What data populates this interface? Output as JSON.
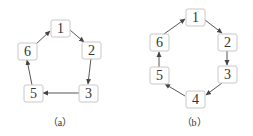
{
  "figures": [
    {
      "id": "a",
      "caption": "（a）",
      "nodes": [
        {
          "label": "1",
          "x": 51,
          "y": 20
        },
        {
          "label": "2",
          "x": 82,
          "y": 42
        },
        {
          "label": "3",
          "x": 79,
          "y": 85
        },
        {
          "label": "5",
          "x": 24,
          "y": 85
        },
        {
          "label": "6",
          "x": 18,
          "y": 43
        }
      ],
      "edges": [
        [
          "1",
          "2"
        ],
        [
          "2",
          "3"
        ],
        [
          "3",
          "5"
        ],
        [
          "5",
          "6"
        ],
        [
          "6",
          "1"
        ]
      ]
    },
    {
      "id": "b",
      "caption": "（b）",
      "nodes": [
        {
          "label": "1",
          "x": 186,
          "y": 9
        },
        {
          "label": "2",
          "x": 218,
          "y": 34
        },
        {
          "label": "3",
          "x": 218,
          "y": 66
        },
        {
          "label": "4",
          "x": 186,
          "y": 91
        },
        {
          "label": "5",
          "x": 150,
          "y": 67
        },
        {
          "label": "6",
          "x": 150,
          "y": 34
        }
      ],
      "edges": [
        [
          "1",
          "2"
        ],
        [
          "2",
          "3"
        ],
        [
          "3",
          "4"
        ],
        [
          "4",
          "5"
        ],
        [
          "5",
          "6"
        ],
        [
          "6",
          "1"
        ]
      ]
    }
  ],
  "captions": {
    "a": "（a）",
    "b": "（b）"
  },
  "labels": {
    "a1": "1",
    "a2": "2",
    "a3": "3",
    "a5": "5",
    "a6": "6",
    "b1": "1",
    "b2": "2",
    "b3": "3",
    "b4": "4",
    "b5": "5",
    "b6": "6"
  }
}
